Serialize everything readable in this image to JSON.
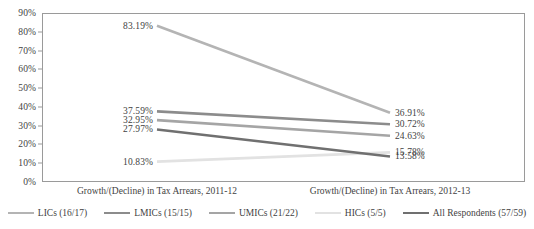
{
  "chart_data": {
    "type": "line",
    "title": "",
    "xlabel": "",
    "ylabel": "",
    "categories": [
      "Growth/(Decline) in Tax Arrears, 2011-12",
      "Growth/(Decline) in Tax Arrears, 2012-13"
    ],
    "ylim": [
      0,
      90
    ],
    "ytick_labels": [
      "0%",
      "10%",
      "20%",
      "30%",
      "40%",
      "50%",
      "60%",
      "70%",
      "80%",
      "90%"
    ],
    "ytick_values": [
      0,
      10,
      20,
      30,
      40,
      50,
      60,
      70,
      80,
      90
    ],
    "grid": false,
    "legend_position": "bottom",
    "series": [
      {
        "name": "LICs (16/17)",
        "color": "#b4b4b4",
        "values": [
          83.19,
          36.91
        ],
        "labels": [
          "83.19%",
          "36.91%"
        ]
      },
      {
        "name": "LMICs (15/15)",
        "color": "#8c8c8c",
        "values": [
          37.59,
          30.72
        ],
        "labels": [
          "37.59%",
          "30.72%"
        ]
      },
      {
        "name": "UMICs (21/22)",
        "color": "#a5a5a5",
        "values": [
          32.95,
          24.63
        ],
        "labels": [
          "32.95%",
          "24.63%"
        ]
      },
      {
        "name": "HICs (5/5)",
        "color": "#e2e2e2",
        "values": [
          10.83,
          15.78
        ],
        "labels": [
          "10.83%",
          "15.78%"
        ]
      },
      {
        "name": "All Respondents (57/59)",
        "color": "#707070",
        "values": [
          27.97,
          13.58
        ],
        "labels": [
          "27.97%",
          "13.58%"
        ]
      }
    ]
  },
  "axis": {
    "frame_color": "#9a9a9a"
  }
}
